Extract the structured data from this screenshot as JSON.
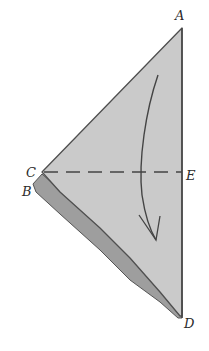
{
  "diagram": {
    "type": "origami-fold-step",
    "labels": {
      "A": "A",
      "B": "B",
      "C": "C",
      "D": "D",
      "E": "E"
    },
    "fold_line": "C-E (dashed valley fold)",
    "arrow": "fold top half down along C-E",
    "colors": {
      "paper": "#c9c9c9",
      "paper_back": "#9e9e9e",
      "outline": "#555555",
      "background": "#ffffff"
    }
  }
}
